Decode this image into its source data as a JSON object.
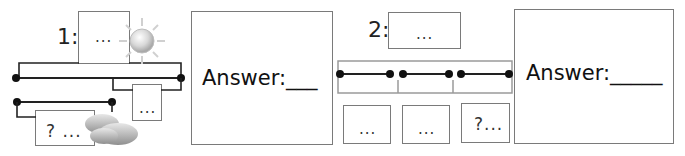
{
  "problem1": {
    "number": "1:",
    "top_box": "...",
    "right_box": "...",
    "bottom_box": "? ...",
    "sun_icon": "sun-icon",
    "cloud_icon": "cloud-icon"
  },
  "answer1": {
    "label": "Answer:___"
  },
  "problem2": {
    "number": "2:",
    "top_box": "...",
    "bottom_boxes": [
      "...",
      "...",
      "?..."
    ]
  },
  "answer2": {
    "label": "Answer:_____"
  },
  "colors": {
    "line": "#222222",
    "box_border": "#7a7a7a",
    "bracket": "#9a9a9a"
  }
}
